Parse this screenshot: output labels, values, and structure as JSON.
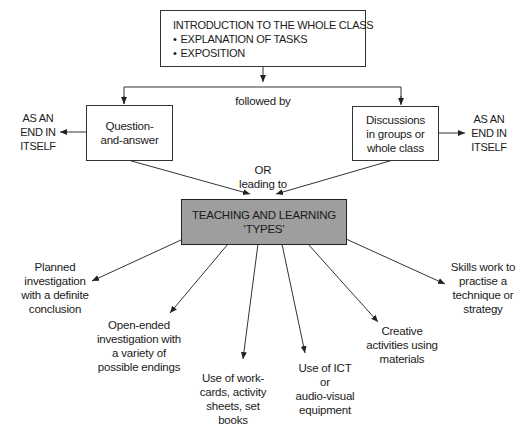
{
  "diagram": {
    "intro_box": {
      "title": "INTRODUCTION TO THE WHOLE CLASS",
      "bullets": [
        "EXPLANATION OF TASKS",
        "EXPOSITION"
      ]
    },
    "connector_followed_by": "followed by",
    "connector_or": "OR",
    "connector_leading_to": "leading to",
    "left_branch": {
      "box_lines": [
        "Question-",
        "and-answer"
      ],
      "end_label_lines": [
        "AS AN",
        "END IN",
        "ITSELF"
      ]
    },
    "right_branch": {
      "box_lines": [
        "Discussions",
        "in groups or",
        "whole class"
      ],
      "end_label_lines": [
        "AS AN",
        "END IN",
        "ITSELF"
      ]
    },
    "center_box": {
      "lines": [
        "TEACHING AND LEARNING",
        "‘TYPES’"
      ],
      "fill_color": "#9e9e9e"
    },
    "types": [
      {
        "id": "planned",
        "lines": [
          "Planned",
          "investigation",
          "with a definite",
          "conclusion"
        ]
      },
      {
        "id": "open-ended",
        "lines": [
          "Open-ended",
          "investigation with",
          "a variety of",
          "possible endings"
        ]
      },
      {
        "id": "work-cards",
        "lines": [
          "Use of work-",
          "cards, activity",
          "sheets, set books"
        ]
      },
      {
        "id": "ict",
        "lines": [
          "Use of ICT",
          "or",
          "audio-visual",
          "equipment"
        ]
      },
      {
        "id": "creative",
        "lines": [
          "Creative",
          "activities using",
          "materials"
        ]
      },
      {
        "id": "skills",
        "lines": [
          "Skills work to",
          "practise a",
          "technique or",
          "strategy"
        ]
      }
    ]
  }
}
